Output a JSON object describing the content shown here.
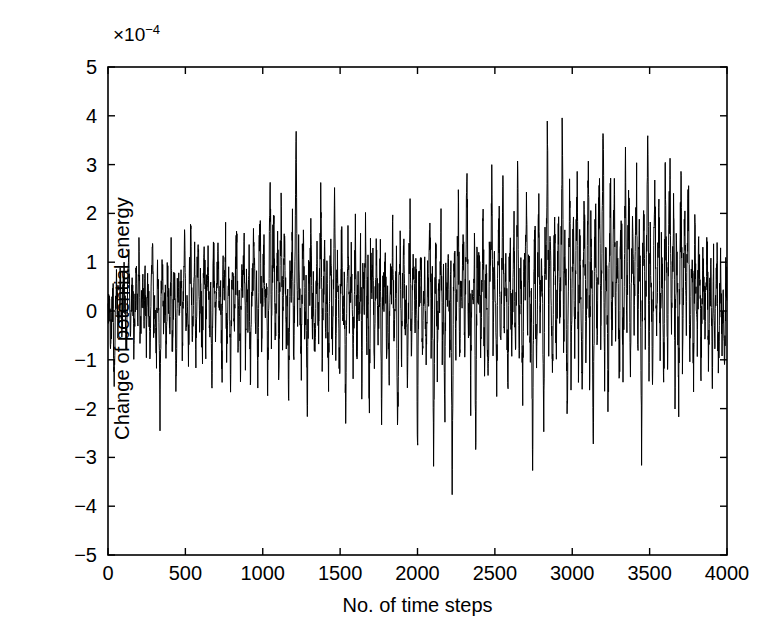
{
  "chart_data": {
    "type": "line",
    "title": "",
    "subtitle": "",
    "xlabel": "No. of time steps",
    "ylabel": "Change of potential energy",
    "y_multiplier_text": "×10",
    "y_multiplier_exponent": "−4",
    "y_multiplier_value": 0.0001,
    "xlim": [
      0,
      4000
    ],
    "ylim": [
      -5,
      5
    ],
    "xticks": [
      0,
      500,
      1000,
      1500,
      2000,
      2500,
      3000,
      3500,
      4000
    ],
    "yticks": [
      -5,
      -4,
      -3,
      -2,
      -1,
      0,
      1,
      2,
      3,
      4,
      5
    ],
    "xticklabels": [
      "0",
      "500",
      "1000",
      "1500",
      "2000",
      "2500",
      "3000",
      "3500",
      "4000"
    ],
    "yticklabels": [
      "5",
      "4",
      "3",
      "2",
      "1",
      "0",
      "−1",
      "−2",
      "−3",
      "−4",
      "−5"
    ],
    "grid": false,
    "legend": null,
    "line_color": "#000000",
    "line_width": 1,
    "background_color": "#ffffff",
    "axis_color": "#000000",
    "tick_direction": "in",
    "box": true,
    "series": [
      {
        "name": "Change of potential energy",
        "x_start": 0,
        "x_step": 8,
        "values": [
          -0.1,
          0.3,
          -0.6,
          -0.2,
          0.5,
          -1.5,
          0.2,
          0.6,
          -0.3,
          0.1,
          0.8,
          -0.4,
          0.2,
          1.0,
          -0.2,
          -0.7,
          0.4,
          0.9,
          -0.5,
          0.2,
          0.6,
          -1.0,
          0.3,
          0.7,
          -0.2,
          1.1,
          -0.6,
          0.1,
          0.5,
          -0.3,
          0.9,
          -0.8,
          0.4,
          0.2,
          -1.2,
          0.6,
          1.3,
          -0.4,
          0.3,
          -0.9,
          0.7,
          0.2,
          -2.0,
          0.5,
          1.0,
          -0.3,
          0.6,
          -1.1,
          0.8,
          0.2,
          -0.5,
          1.2,
          -0.7,
          0.3,
          0.9,
          -1.4,
          0.4,
          0.7,
          -0.2,
          1.1,
          -0.6,
          0.5,
          1.4,
          -0.3,
          0.2,
          -1.0,
          0.8,
          1.6,
          -0.5,
          0.4,
          1.2,
          -0.8,
          0.6,
          1.5,
          -0.3,
          0.9,
          -1.2,
          0.5,
          1.3,
          -0.6,
          0.7,
          1.0,
          -0.4,
          0.3,
          -1.5,
          0.8,
          1.1,
          -0.7,
          0.5,
          1.4,
          -0.2,
          0.6,
          -1.3,
          0.9,
          0.3,
          1.2,
          -0.9,
          0.4,
          0.7,
          -1.6,
          0.5,
          1.0,
          -0.3,
          0.8,
          1.5,
          -0.6,
          0.2,
          -1.1,
          0.9,
          0.4,
          1.3,
          -0.8,
          0.6,
          -0.2,
          1.1,
          -1.4,
          0.3,
          0.8,
          1.7,
          -0.5,
          0.4,
          -1.0,
          0.9,
          2.0,
          -0.7,
          0.5,
          1.2,
          -0.3,
          0.8,
          -1.5,
          0.6,
          2.8,
          -0.4,
          1.0,
          1.9,
          -0.8,
          0.3,
          1.4,
          -1.2,
          0.7,
          2.2,
          -0.5,
          0.9,
          1.1,
          -0.6,
          0.4,
          -1.8,
          1.0,
          0.5,
          1.6,
          -0.9,
          0.6,
          3.7,
          -0.4,
          1.2,
          0.3,
          -1.3,
          0.8,
          1.5,
          -0.7,
          0.5,
          -2.0,
          1.0,
          0.4,
          1.8,
          -0.6,
          0.9,
          -1.1,
          0.3,
          1.3,
          -0.5,
          0.7,
          2.4,
          -1.0,
          0.6,
          1.1,
          -0.4,
          0.8,
          -1.6,
          0.5,
          1.4,
          -0.9,
          0.3,
          2.7,
          -0.7,
          1.0,
          0.4,
          -1.4,
          0.9,
          1.2,
          -0.5,
          0.6,
          -2.1,
          0.8,
          1.5,
          -0.3,
          0.7,
          1.0,
          -1.2,
          0.4,
          1.8,
          -0.8,
          0.5,
          -0.2,
          1.3,
          -1.7,
          0.9,
          0.3,
          1.6,
          -0.6,
          0.7,
          -2.4,
          1.1,
          0.4,
          0.9,
          -1.0,
          0.5,
          1.4,
          -0.7,
          0.2,
          1.0,
          -1.9,
          0.6,
          0.3,
          1.2,
          -0.8,
          0.4,
          -1.3,
          0.9,
          0.5,
          1.7,
          -0.6,
          0.2,
          0.8,
          -2.6,
          0.4,
          1.1,
          -0.9,
          0.6,
          1.3,
          -0.4,
          0.3,
          -1.5,
          0.7,
          2.0,
          -1.0,
          0.5,
          0.9,
          -0.3,
          1.2,
          -2.9,
          0.6,
          0.4,
          1.5,
          -0.8,
          0.2,
          1.0,
          -1.4,
          0.7,
          0.3,
          1.8,
          -0.5,
          0.9,
          -3.2,
          0.4,
          1.3,
          -1.1,
          0.6,
          0.2,
          1.6,
          -0.7,
          0.5,
          -2.2,
          1.0,
          0.3,
          1.4,
          -0.9,
          0.8,
          -3.6,
          0.4,
          1.2,
          -0.6,
          0.9,
          2.1,
          -1.0,
          0.5,
          0.3,
          1.7,
          -0.8,
          0.6,
          3.1,
          -0.4,
          1.0,
          -1.6,
          0.7,
          0.2,
          1.3,
          -2.8,
          0.9,
          0.5,
          1.1,
          -0.7,
          0.4,
          2.3,
          -1.2,
          0.8,
          0.3,
          -1.9,
          1.5,
          0.6,
          2.6,
          -0.5,
          1.0,
          0.2,
          -1.4,
          0.9,
          1.8,
          -0.8,
          0.4,
          2.9,
          -0.6,
          1.2,
          0.5,
          -2.0,
          0.8,
          1.4,
          -1.0,
          0.3,
          1.9,
          -0.7,
          0.6,
          3.0,
          -1.3,
          0.9,
          0.4,
          -1.7,
          1.1,
          0.7,
          2.4,
          -0.5,
          1.5,
          -0.9,
          0.3,
          -3.1,
          0.8,
          1.2,
          -1.1,
          0.6,
          2.2,
          -0.4,
          1.0,
          0.5,
          -2.5,
          1.6,
          0.9,
          3.9,
          -0.7,
          1.3,
          0.4,
          -1.5,
          0.8,
          2.0,
          -1.0,
          0.6,
          1.7,
          -0.3,
          1.1,
          4.2,
          -0.8,
          1.4,
          0.5,
          -2.3,
          0.9,
          2.7,
          -1.2,
          0.7,
          1.9,
          -0.5,
          1.0,
          2.4,
          -0.9,
          1.5,
          0.4,
          -1.8,
          1.2,
          2.1,
          -0.6,
          0.8,
          3.3,
          -1.1,
          1.6,
          0.5,
          -2.7,
          1.0,
          1.8,
          -0.7,
          1.3,
          2.5,
          -0.4,
          0.9,
          3.9,
          -1.4,
          1.1,
          0.6,
          -2.1,
          1.7,
          2.2,
          -0.8,
          1.0,
          2.9,
          -0.5,
          1.4,
          0.7,
          -1.6,
          2.0,
          1.2,
          -1.0,
          0.8,
          3.0,
          -0.6,
          1.5,
          2.3,
          -1.3,
          0.9,
          1.8,
          -0.4,
          1.1,
          2.6,
          -0.9,
          1.6,
          0.5,
          -2.4,
          1.3,
          2.0,
          -0.7,
          1.0,
          3.6,
          -1.2,
          1.4,
          0.6,
          -1.9,
          1.7,
          2.2,
          -0.5,
          0.9,
          2.4,
          -1.0,
          1.2,
          0.7,
          -1.5,
          2.8,
          1.1,
          -0.8,
          1.5,
          3.0,
          -0.4,
          1.0,
          2.1,
          -1.3,
          1.6,
          0.5,
          -1.7,
          1.2,
          2.5,
          -0.9,
          0.8,
          1.9,
          -0.6,
          1.4,
          2.2,
          -1.1,
          0.7,
          1.0,
          -1.4,
          1.8,
          0.4,
          -0.8,
          1.3,
          0.9,
          -1.2,
          0.6,
          1.1,
          -0.5,
          0.8,
          1.5,
          -1.0,
          0.3,
          0.7,
          -1.3,
          1.2,
          -0.6,
          0.5,
          0.9,
          -1.5,
          0.4,
          1.0,
          -0.7,
          0.2,
          -1.1,
          0.6
        ]
      }
    ]
  },
  "axes": {
    "exponent_prefix": "×10",
    "exponent_value": "−4"
  }
}
